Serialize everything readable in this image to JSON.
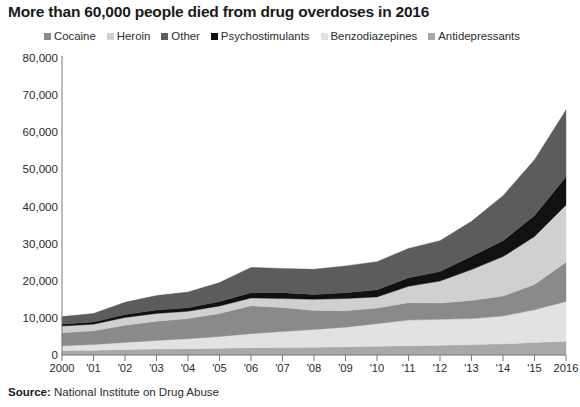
{
  "title": "More than 60,000 people died from drug overdoses in 2016",
  "source": {
    "keyword": "Source:",
    "text": " National Institute on Drug Abuse"
  },
  "legend": {
    "position": "top",
    "items": [
      {
        "label": "Cocaine",
        "color": "#8a8a8a",
        "icon": "square-swatch-icon"
      },
      {
        "label": "Heroin",
        "color": "#d0d0d0",
        "icon": "square-swatch-icon"
      },
      {
        "label": "Other",
        "color": "#5c5c5c",
        "icon": "square-swatch-icon"
      },
      {
        "label": "Psychostimulants",
        "color": "#111111",
        "icon": "square-swatch-icon"
      },
      {
        "label": "Benzodiazepines",
        "color": "#e2e2e2",
        "icon": "square-swatch-icon"
      },
      {
        "label": "Antidepressants",
        "color": "#a8a8a8",
        "icon": "square-swatch-icon"
      }
    ]
  },
  "axes": {
    "y_ticks": [
      "80,000",
      "70,000",
      "60,000",
      "50,000",
      "40,000",
      "30,000",
      "20,000",
      "10,000",
      "0"
    ],
    "x_ticks": [
      "2000",
      "'01",
      "'02",
      "'03",
      "'04",
      "'05",
      "'06",
      "'07",
      "'08",
      "'09",
      "'10",
      "'11",
      "'12",
      "'13",
      "'14",
      "'15",
      "2016"
    ]
  },
  "chart_data": {
    "type": "area",
    "stacked": true,
    "title": "More than 60,000 people died from drug overdoses in 2016",
    "xlabel": "",
    "ylabel": "",
    "ylim": [
      0,
      80000
    ],
    "ytick_values": [
      0,
      10000,
      20000,
      30000,
      40000,
      50000,
      60000,
      70000,
      80000
    ],
    "grid": false,
    "legend_position": "top",
    "categories": [
      2000,
      2001,
      2002,
      2003,
      2004,
      2005,
      2006,
      2007,
      2008,
      2009,
      2010,
      2011,
      2012,
      2013,
      2014,
      2015,
      2016
    ],
    "xtick_labels": [
      "2000",
      "'01",
      "'02",
      "'03",
      "'04",
      "'05",
      "'06",
      "'07",
      "'08",
      "'09",
      "'10",
      "'11",
      "'12",
      "'13",
      "'14",
      "'15",
      "2016"
    ],
    "stack_order_bottom_to_top": [
      "Antidepressants",
      "Benzodiazepines",
      "Cocaine",
      "Heroin",
      "Psychostimulants",
      "Other"
    ],
    "series": [
      {
        "name": "Antidepressants",
        "color": "#a8a8a8",
        "values": [
          1200,
          1300,
          1500,
          1600,
          1700,
          1800,
          1950,
          2000,
          2100,
          2200,
          2350,
          2500,
          2600,
          2800,
          3000,
          3400,
          3700
        ]
      },
      {
        "name": "Benzodiazepines",
        "color": "#e2e2e2",
        "values": [
          1300,
          1500,
          1900,
          2300,
          2700,
          3200,
          3800,
          4300,
          4800,
          5300,
          6100,
          6900,
          7000,
          7000,
          7500,
          8800,
          10700
        ]
      },
      {
        "name": "Cocaine",
        "color": "#8a8a8a",
        "values": [
          3500,
          3700,
          4600,
          5200,
          5400,
          6200,
          7500,
          6500,
          5100,
          4400,
          4200,
          4700,
          4400,
          4900,
          5400,
          6800,
          10600
        ]
      },
      {
        "name": "Heroin",
        "color": "#d0d0d0",
        "values": [
          1800,
          1800,
          2100,
          2100,
          2000,
          2000,
          2100,
          2400,
          3000,
          3300,
          3000,
          4400,
          5900,
          8300,
          10600,
          12900,
          15400
        ]
      },
      {
        "name": "Psychostimulants",
        "color": "#111111",
        "values": [
          550,
          600,
          800,
          900,
          950,
          1200,
          1450,
          1600,
          1300,
          1600,
          1900,
          2300,
          2600,
          3600,
          4300,
          5700,
          7600
        ]
      },
      {
        "name": "Other",
        "color": "#5c5c5c",
        "values": [
          2000,
          2300,
          3300,
          3900,
          4200,
          5100,
          6800,
          6500,
          6800,
          7200,
          7600,
          7900,
          8300,
          9400,
          12100,
          15000,
          18000
        ]
      }
    ],
    "totals": [
      10350,
      11200,
      14200,
      16000,
      16950,
      19500,
      23600,
      23300,
      23100,
      24000,
      25150,
      28700,
      30800,
      36000,
      42900,
      52600,
      66000
    ],
    "annotations": []
  }
}
